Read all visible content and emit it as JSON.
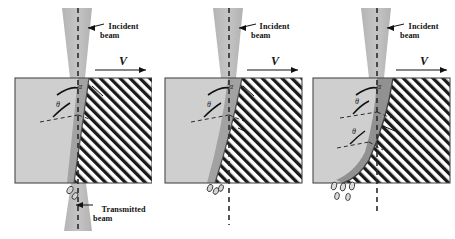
{
  "figure": {
    "panel_count": 3,
    "colors": {
      "workpiece_fill": "#cfcfcf",
      "workpiece_cut_fill": "#b4b4b4",
      "hatch_line": "#1a1a1a",
      "hatch_bg": "#ffffff",
      "beam_fill": "#b9b9b9",
      "kerf_fill": "#8c8c8c",
      "outline": "#3a3a3a",
      "dashed_axis": "#2a2a2a",
      "text": "#111111"
    }
  },
  "labels": {
    "incident_beam_line1": "Incident",
    "incident_beam_line2": "beam",
    "transmitted_beam_line1": "Transmitted",
    "transmitted_beam_line2": "beam",
    "velocity": "V",
    "alpha": "α",
    "theta": "θ"
  },
  "panels": [
    {
      "id": "panel-1",
      "name": "early-stage-cut",
      "stage": 1,
      "angles": [
        {
          "symbol": "α",
          "x": 74,
          "y": 87
        },
        {
          "symbol": "θ",
          "x": 56,
          "y": 106
        }
      ],
      "has_incident_label": true,
      "has_transmitted_label": true,
      "has_velocity_arrow": true,
      "droplet_count": 2
    },
    {
      "id": "panel-2",
      "name": "mid-stage-cut",
      "stage": 2,
      "angles": [
        {
          "symbol": "α",
          "x": 74,
          "y": 87
        },
        {
          "symbol": "θ",
          "x": 56,
          "y": 106
        }
      ],
      "has_incident_label": true,
      "has_transmitted_label": false,
      "has_velocity_arrow": true,
      "droplet_count": 3
    },
    {
      "id": "panel-3",
      "name": "late-stage-cut",
      "stage": 3,
      "angles": [
        {
          "symbol": "α",
          "x": 74,
          "y": 87
        },
        {
          "symbol": "θ",
          "x": 56,
          "y": 104
        },
        {
          "symbol": "θ",
          "x": 56,
          "y": 133
        }
      ],
      "has_incident_label": true,
      "has_transmitted_label": false,
      "has_velocity_arrow": true,
      "droplet_count": 5
    }
  ]
}
